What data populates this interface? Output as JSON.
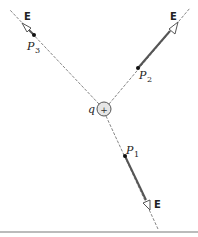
{
  "diagram": {
    "charge": {
      "label": "q",
      "sign": "+"
    },
    "field_label": "E",
    "points": [
      {
        "name": "P",
        "sub": "1"
      },
      {
        "name": "P",
        "sub": "2"
      },
      {
        "name": "P",
        "sub": "3"
      }
    ],
    "colors": {
      "line": "#555555",
      "thick": "#555555",
      "charge_fill": "#e6e6e6",
      "bottom_rule": "#bbbbbb"
    }
  }
}
